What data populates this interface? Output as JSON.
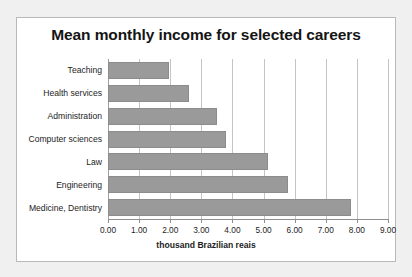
{
  "chart_data": {
    "type": "bar",
    "orientation": "horizontal",
    "title": "Mean monthly income for selected careers",
    "xlabel": "thousand Brazilian reais",
    "ylabel": "",
    "xlim": [
      0,
      9
    ],
    "xticks": [
      "0.00",
      "1.00",
      "2.00",
      "3.00",
      "4.00",
      "5.00",
      "6.00",
      "7.00",
      "8.00",
      "9.00"
    ],
    "grid": "vertical",
    "legend": null,
    "categories": [
      "Teaching",
      "Health services",
      "Administration",
      "Computer sciences",
      "Law",
      "Engineering",
      "Medicine, Dentistry"
    ],
    "values": [
      1.95,
      2.6,
      3.5,
      3.8,
      5.15,
      5.8,
      7.8
    ],
    "bar_color": "#9a9a9a",
    "bar_border_color": "#8c8c8c",
    "gridline_color": "#c4c4c4",
    "frame_color": "#b9b9b9",
    "background": "#ffffff",
    "page_background": "#f0f0f0"
  }
}
